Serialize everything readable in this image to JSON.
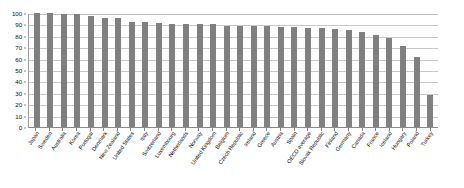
{
  "chart_data": {
    "type": "bar",
    "title": "",
    "subtitle": "",
    "xlabel": "",
    "ylabel": "",
    "ylim": [
      0,
      100
    ],
    "ytick_labels": [
      "100",
      "90",
      "80",
      "70",
      "60",
      "50",
      "40",
      "30",
      "20",
      "10",
      "0"
    ],
    "ytick_values": [
      100,
      90,
      80,
      70,
      60,
      50,
      40,
      30,
      20,
      10,
      0
    ],
    "grid": true,
    "legend": false,
    "legend_position": "none",
    "bar_color": "#808080",
    "gridline_color": "#c9c9c9",
    "axis_color": "#8a8a8a",
    "categories": [
      "Japan",
      "Sweden",
      "Australia",
      "Korea",
      "Portugal",
      "Denmark",
      "New Zealand",
      "United States",
      "Italy",
      "Switzerland",
      "Luxembourg",
      "Netherlands",
      "Norway",
      "United Kingdom",
      "Belgium",
      "Czech Republic",
      "Ireland",
      "Greece",
      "Austria",
      "Spain",
      "OECD average",
      "Slovak Republic",
      "Finland",
      "Germany",
      "Canada",
      "France",
      "Iceland",
      "Hungary",
      "Poland",
      "Turkey"
    ],
    "values": [
      100,
      100,
      99,
      99,
      97,
      96,
      96,
      92,
      92,
      91,
      90,
      90,
      90,
      90,
      89,
      89,
      89,
      89,
      88,
      88,
      87,
      87,
      86,
      85,
      83,
      81,
      78,
      71,
      61,
      28
    ]
  }
}
